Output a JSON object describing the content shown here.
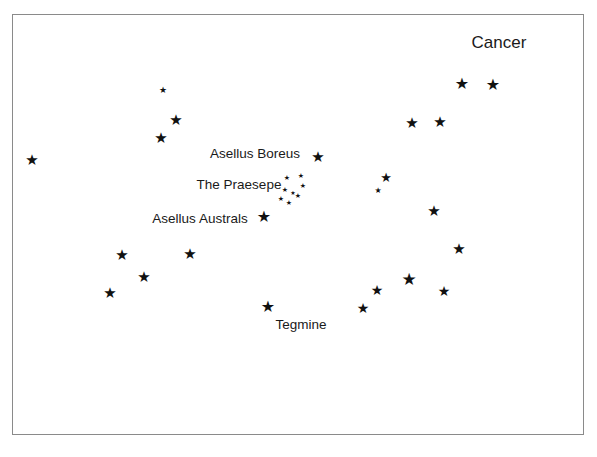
{
  "chart": {
    "title": "Cancer",
    "kind": "constellation-star-chart",
    "background_color": "#ffffff",
    "frame_color": "#8a8a8a",
    "star_color": "#111111",
    "label_color": "#1a1a1a",
    "frame": {
      "x": 12,
      "y": 14,
      "width": 572,
      "height": 421
    }
  },
  "chart_data": {
    "type": "scatter",
    "title": "Cancer",
    "xlabel": "",
    "ylabel": "",
    "xlim": [
      12,
      584
    ],
    "ylim": [
      14,
      435
    ],
    "grid": false,
    "legend": false,
    "note": "Star positions in pixel coordinates; 'size' is the rendered glyph size in px, a proxy for stellar magnitude (larger = brighter).",
    "points": [
      {
        "name": "star-far-left",
        "x": 32,
        "y": 160,
        "size": 15
      },
      {
        "name": "star-upper-left-small",
        "x": 163,
        "y": 90,
        "size": 9
      },
      {
        "name": "star-upper-left-mid",
        "x": 176,
        "y": 120,
        "size": 15
      },
      {
        "name": "star-upper-left-lower",
        "x": 161,
        "y": 138,
        "size": 15
      },
      {
        "name": "star-asellus-boreus",
        "x": 318,
        "y": 157,
        "size": 15
      },
      {
        "name": "star-right-of-boreus-label",
        "x": 386,
        "y": 177,
        "size": 13
      },
      {
        "name": "star-small-below-boreus",
        "x": 378,
        "y": 191,
        "size": 8
      },
      {
        "name": "star-asellus-australis",
        "x": 264,
        "y": 217,
        "size": 16
      },
      {
        "name": "star-left-mid",
        "x": 122,
        "y": 255,
        "size": 15
      },
      {
        "name": "star-left-lower-mid",
        "x": 144,
        "y": 277,
        "size": 15
      },
      {
        "name": "star-left-lowest",
        "x": 110,
        "y": 293,
        "size": 15
      },
      {
        "name": "star-center-left-lower",
        "x": 190,
        "y": 254,
        "size": 15
      },
      {
        "name": "star-tegmine",
        "x": 268,
        "y": 307,
        "size": 16
      },
      {
        "name": "star-bottom-center-right",
        "x": 363,
        "y": 308,
        "size": 14
      },
      {
        "name": "star-lower-right-a",
        "x": 377,
        "y": 290,
        "size": 14
      },
      {
        "name": "star-lower-right-b",
        "x": 409,
        "y": 279,
        "size": 17
      },
      {
        "name": "star-lower-right-c",
        "x": 444,
        "y": 291,
        "size": 14
      },
      {
        "name": "star-right-mid-lower",
        "x": 459,
        "y": 249,
        "size": 15
      },
      {
        "name": "star-right-mid",
        "x": 434,
        "y": 211,
        "size": 15
      },
      {
        "name": "star-upper-right-a",
        "x": 412,
        "y": 123,
        "size": 15
      },
      {
        "name": "star-upper-right-b",
        "x": 440,
        "y": 122,
        "size": 15
      },
      {
        "name": "star-top-right-a",
        "x": 462,
        "y": 84,
        "size": 16
      },
      {
        "name": "star-top-right-b",
        "x": 493,
        "y": 85,
        "size": 16
      },
      {
        "name": "praesepe-member-1",
        "x": 287,
        "y": 178,
        "size": 7
      },
      {
        "name": "praesepe-member-2",
        "x": 301,
        "y": 176,
        "size": 7
      },
      {
        "name": "praesepe-member-3",
        "x": 285,
        "y": 190,
        "size": 7
      },
      {
        "name": "praesepe-member-4",
        "x": 303,
        "y": 186,
        "size": 7
      },
      {
        "name": "praesepe-member-5",
        "x": 281,
        "y": 199,
        "size": 7
      },
      {
        "name": "praesepe-member-6",
        "x": 289,
        "y": 203,
        "size": 7
      },
      {
        "name": "praesepe-member-7",
        "x": 298,
        "y": 196,
        "size": 7
      },
      {
        "name": "praesepe-member-8",
        "x": 293,
        "y": 193,
        "size": 6
      }
    ],
    "annotations": [
      {
        "name": "title",
        "text": "Cancer",
        "x": 499,
        "y": 42,
        "size": 17
      },
      {
        "name": "asellus-boreus-label",
        "text": "Asellus Boreus",
        "x": 255,
        "y": 154,
        "size": 13.5
      },
      {
        "name": "the-praesepe-label",
        "text": "The Praesepe",
        "x": 239,
        "y": 185,
        "size": 13.5
      },
      {
        "name": "asellus-australis-label",
        "text": "Asellus Australs",
        "x": 200,
        "y": 219,
        "size": 13.5
      },
      {
        "name": "tegmine-label",
        "text": "Tegmine",
        "x": 301,
        "y": 325,
        "size": 13.5
      }
    ]
  }
}
